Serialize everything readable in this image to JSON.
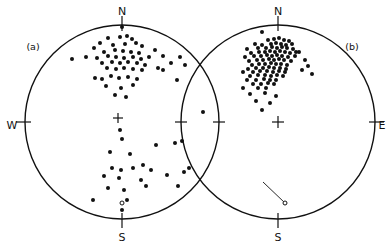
{
  "figure": {
    "width": 391,
    "height": 244,
    "background": "#ffffff",
    "ink_color": "#111111",
    "caption_a": "(a)",
    "caption_b": "(b)"
  },
  "chart_data": {
    "type": "scatter",
    "title": "",
    "subtitle": "",
    "xlabel": "",
    "ylabel": "",
    "projection": "equal-area stereonet (lower hemisphere)",
    "grid": false,
    "legend_position": "none",
    "panels": [
      {
        "id": "a",
        "label": "(a)",
        "label_x": 33,
        "label_y": 47,
        "center_x": 122,
        "center_y": 122,
        "radius": 97,
        "axis_ticks": [
          {
            "name": "N",
            "label": "N",
            "angle_deg": 0,
            "label_x": 122,
            "label_y": 12
          },
          {
            "name": "E",
            "label": "",
            "angle_deg": 90,
            "label_x": 0,
            "label_y": 0
          },
          {
            "name": "S",
            "label": "S",
            "angle_deg": 180,
            "label_x": 122,
            "label_y": 238
          },
          {
            "name": "W",
            "label": "W",
            "angle_deg": 270,
            "label_x": 12,
            "label_y": 126
          }
        ],
        "center_marker": {
          "type": "cross",
          "x": 118,
          "y": 118,
          "size": 5
        },
        "filled_points": [
          [
            122,
            27
          ],
          [
            108,
            38
          ],
          [
            120,
            37
          ],
          [
            127,
            36
          ],
          [
            132,
            39
          ],
          [
            100,
            43
          ],
          [
            113,
            45
          ],
          [
            125,
            44
          ],
          [
            136,
            43
          ],
          [
            142,
            46
          ],
          [
            72,
            59
          ],
          [
            94,
            48
          ],
          [
            104,
            52
          ],
          [
            115,
            50
          ],
          [
            123,
            51
          ],
          [
            131,
            52
          ],
          [
            139,
            53
          ],
          [
            86,
            57
          ],
          [
            97,
            58
          ],
          [
            108,
            56
          ],
          [
            116,
            57
          ],
          [
            124,
            58
          ],
          [
            133,
            57
          ],
          [
            141,
            59
          ],
          [
            149,
            57
          ],
          [
            102,
            63
          ],
          [
            112,
            62
          ],
          [
            120,
            63
          ],
          [
            128,
            62
          ],
          [
            137,
            63
          ],
          [
            145,
            65
          ],
          [
            107,
            68
          ],
          [
            116,
            69
          ],
          [
            124,
            68
          ],
          [
            133,
            69
          ],
          [
            142,
            70
          ],
          [
            155,
            50
          ],
          [
            163,
            56
          ],
          [
            171,
            63
          ],
          [
            158,
            68
          ],
          [
            163,
            70
          ],
          [
            180,
            57
          ],
          [
            185,
            65
          ],
          [
            95,
            78
          ],
          [
            102,
            79
          ],
          [
            111,
            76
          ],
          [
            119,
            78
          ],
          [
            128,
            77
          ],
          [
            137,
            79
          ],
          [
            106,
            86
          ],
          [
            121,
            88
          ],
          [
            133,
            85
          ],
          [
            115,
            95
          ],
          [
            126,
            97
          ],
          [
            177,
            80
          ],
          [
            120,
            130
          ],
          [
            122,
            139
          ],
          [
            110,
            152
          ],
          [
            130,
            154
          ],
          [
            156,
            145
          ],
          [
            175,
            143
          ],
          [
            182,
            141
          ],
          [
            112,
            168
          ],
          [
            121,
            170
          ],
          [
            133,
            168
          ],
          [
            143,
            165
          ],
          [
            151,
            170
          ],
          [
            104,
            176
          ],
          [
            119,
            178
          ],
          [
            141,
            180
          ],
          [
            167,
            175
          ],
          [
            184,
            172
          ],
          [
            189,
            168
          ],
          [
            108,
            188
          ],
          [
            124,
            190
          ],
          [
            146,
            186
          ],
          [
            178,
            186
          ],
          [
            93,
            200
          ],
          [
            127,
            200
          ],
          [
            122,
            210
          ]
        ],
        "open_points": [
          [
            122,
            203
          ]
        ],
        "segments": []
      },
      {
        "id": "b",
        "label": "(b)",
        "label_x": 352,
        "label_y": 47,
        "center_x": 278,
        "center_y": 122,
        "radius": 97,
        "axis_ticks": [
          {
            "name": "N",
            "label": "N",
            "angle_deg": 0,
            "label_x": 278,
            "label_y": 12
          },
          {
            "name": "E",
            "label": "E",
            "angle_deg": 90,
            "label_x": 382,
            "label_y": 126
          },
          {
            "name": "S",
            "label": "S",
            "angle_deg": 180,
            "label_x": 278,
            "label_y": 238
          },
          {
            "name": "W",
            "label": "",
            "angle_deg": 270,
            "label_x": 0,
            "label_y": 0
          }
        ],
        "center_marker": {
          "type": "cross",
          "x": 278,
          "y": 122,
          "size": 6
        },
        "filled_points": [
          [
            262,
            32
          ],
          [
            268,
            40
          ],
          [
            274,
            39
          ],
          [
            279,
            38
          ],
          [
            284,
            40
          ],
          [
            289,
            41
          ],
          [
            255,
            44
          ],
          [
            262,
            45
          ],
          [
            271,
            44
          ],
          [
            276,
            43
          ],
          [
            281,
            44
          ],
          [
            286,
            45
          ],
          [
            292,
            44
          ],
          [
            247,
            49
          ],
          [
            258,
            48
          ],
          [
            266,
            48
          ],
          [
            272,
            47
          ],
          [
            277,
            48
          ],
          [
            282,
            47
          ],
          [
            287,
            48
          ],
          [
            293,
            49
          ],
          [
            251,
            53
          ],
          [
            259,
            52
          ],
          [
            265,
            52
          ],
          [
            270,
            51
          ],
          [
            275,
            52
          ],
          [
            280,
            51
          ],
          [
            285,
            52
          ],
          [
            290,
            53
          ],
          [
            296,
            52
          ],
          [
            245,
            57
          ],
          [
            254,
            56
          ],
          [
            261,
            56
          ],
          [
            267,
            55
          ],
          [
            272,
            56
          ],
          [
            277,
            55
          ],
          [
            282,
            56
          ],
          [
            288,
            57
          ],
          [
            295,
            56
          ],
          [
            249,
            61
          ],
          [
            257,
            60
          ],
          [
            263,
            60
          ],
          [
            269,
            59
          ],
          [
            274,
            60
          ],
          [
            279,
            59
          ],
          [
            284,
            60
          ],
          [
            291,
            61
          ],
          [
            252,
            65
          ],
          [
            259,
            64
          ],
          [
            265,
            64
          ],
          [
            271,
            63
          ],
          [
            276,
            64
          ],
          [
            281,
            64
          ],
          [
            287,
            65
          ],
          [
            248,
            69
          ],
          [
            256,
            68
          ],
          [
            263,
            68
          ],
          [
            269,
            67
          ],
          [
            274,
            68
          ],
          [
            280,
            68
          ],
          [
            286,
            69
          ],
          [
            243,
            72
          ],
          [
            253,
            72
          ],
          [
            260,
            71
          ],
          [
            267,
            71
          ],
          [
            273,
            72
          ],
          [
            279,
            71
          ],
          [
            285,
            72
          ],
          [
            250,
            76
          ],
          [
            258,
            75
          ],
          [
            265,
            75
          ],
          [
            271,
            76
          ],
          [
            277,
            75
          ],
          [
            283,
            76
          ],
          [
            247,
            80
          ],
          [
            256,
            80
          ],
          [
            264,
            79
          ],
          [
            270,
            80
          ],
          [
            276,
            80
          ],
          [
            253,
            84
          ],
          [
            261,
            84
          ],
          [
            268,
            83
          ],
          [
            274,
            84
          ],
          [
            243,
            88
          ],
          [
            258,
            88
          ],
          [
            266,
            88
          ],
          [
            299,
            52
          ],
          [
            305,
            60
          ],
          [
            302,
            70
          ],
          [
            308,
            66
          ],
          [
            312,
            74
          ],
          [
            250,
            94
          ],
          [
            265,
            93
          ],
          [
            276,
            96
          ],
          [
            256,
            101
          ],
          [
            270,
            103
          ],
          [
            262,
            110
          ],
          [
            203,
            112
          ]
        ],
        "open_points": [
          [
            285,
            203
          ]
        ],
        "segments": [
          {
            "x1": 263,
            "y1": 182,
            "x2": 285,
            "y2": 203,
            "from": "filled",
            "to": "open"
          }
        ]
      }
    ]
  }
}
